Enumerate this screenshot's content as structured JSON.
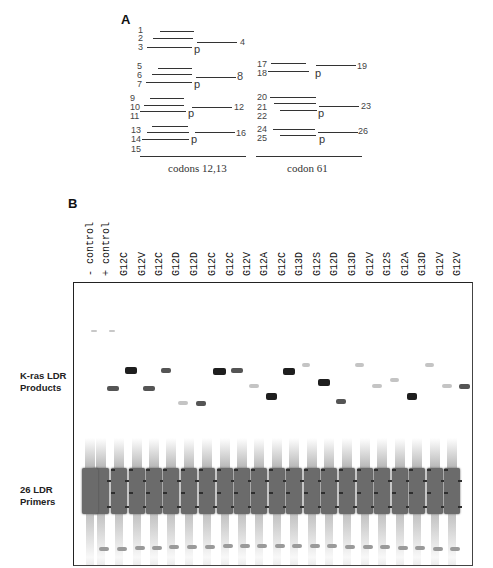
{
  "panel_a": {
    "letter": "A",
    "groups": [
      {
        "caption": "codons 12,13",
        "sets": [
          {
            "left_numbers": [
              "1",
              "2",
              "3"
            ],
            "right_number": "4",
            "p": "p"
          },
          {
            "left_numbers": [
              "5",
              "6",
              "7"
            ],
            "right_number": "8",
            "p": "p"
          },
          {
            "left_numbers": [
              "9",
              "10",
              "11"
            ],
            "right_number": "12",
            "p": "p"
          },
          {
            "left_numbers": [
              "13",
              "14",
              "15"
            ],
            "right_number": "16",
            "p": "p"
          }
        ]
      },
      {
        "caption": "codon 61",
        "sets": [
          {
            "left_numbers": [
              "17",
              "18"
            ],
            "right_number": "19",
            "p": "p"
          },
          {
            "left_numbers": [
              "20",
              "21",
              "22"
            ],
            "right_number": "23",
            "p": "p"
          },
          {
            "left_numbers": [
              "24",
              "25"
            ],
            "right_number": "26",
            "p": "p"
          }
        ]
      }
    ]
  },
  "panel_b": {
    "letter": "B",
    "lane_labels": [
      "- control",
      "+ control",
      "G12C",
      "G12V",
      "G12C",
      "G12D",
      "G12D",
      "G12C",
      "G12C",
      "G12V",
      "G12A",
      "G12C",
      "G13D",
      "G12S",
      "G12D",
      "G13D",
      "G12V",
      "G12S",
      "G12A",
      "G13D",
      "G12V",
      "G12V"
    ],
    "side_labels": {
      "products": [
        "K-ras LDR",
        "Products"
      ],
      "primers": [
        "26 LDR",
        "Primers"
      ]
    },
    "band_colors": {
      "dark": "#1e1e1e",
      "medium": "#555555",
      "faint": "#b5b5b5",
      "primer": "#6b6b6b"
    }
  }
}
